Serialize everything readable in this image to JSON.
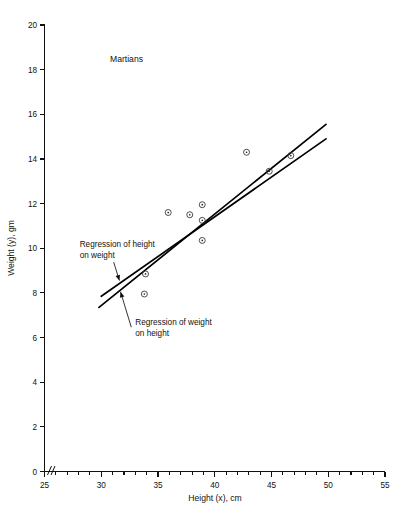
{
  "chart_data": {
    "type": "scatter",
    "title": "Martians",
    "xlabel": "Height (x), cm",
    "ylabel": "Weight (y), gm",
    "xlim": [
      25,
      55
    ],
    "ylim": [
      0,
      20
    ],
    "x_major_ticks": [
      25,
      30,
      35,
      40,
      45,
      50,
      55
    ],
    "x_minor_step": 1,
    "y_major_ticks": [
      0,
      2,
      4,
      6,
      8,
      10,
      12,
      14,
      16,
      18,
      20
    ],
    "x_ticklabels": [
      "25",
      "30",
      "35",
      "40",
      "45",
      "50",
      "55"
    ],
    "y_ticklabels": [
      "0",
      "2",
      "4",
      "6",
      "8",
      "10",
      "12",
      "14",
      "16",
      "18",
      "20"
    ],
    "grid": false,
    "legend": false,
    "axis_break_on_x_origin": true,
    "points": [
      {
        "x": 33.8,
        "y": 7.95
      },
      {
        "x": 33.9,
        "y": 8.85
      },
      {
        "x": 35.9,
        "y": 11.6
      },
      {
        "x": 37.8,
        "y": 11.5
      },
      {
        "x": 38.9,
        "y": 11.95
      },
      {
        "x": 38.9,
        "y": 11.25
      },
      {
        "x": 38.9,
        "y": 10.35
      },
      {
        "x": 42.8,
        "y": 14.3
      },
      {
        "x": 44.8,
        "y": 13.45
      },
      {
        "x": 46.7,
        "y": 14.15
      }
    ],
    "series": [
      {
        "name": "Regression of height on weight",
        "kind": "line",
        "x": [
          30.0,
          49.8
        ],
        "y": [
          7.85,
          14.9
        ]
      },
      {
        "name": "Regression of weight on height",
        "kind": "line",
        "x": [
          29.8,
          49.8
        ],
        "y": [
          7.35,
          15.55
        ]
      }
    ],
    "annotations": [
      {
        "id": "annotation-height-on-weight",
        "line1": "Regression of height",
        "line2": "on weight",
        "text_anchor": {
          "x": 28.1,
          "y": 10.05
        },
        "target": {
          "x": 31.6,
          "y": 8.55
        }
      },
      {
        "id": "annotation-weight-on-height",
        "line1": "Regression of weight",
        "line2": "on height",
        "text_anchor": {
          "x": 33.0,
          "y": 6.55
        },
        "target": {
          "x": 31.7,
          "y": 8.05
        }
      }
    ]
  }
}
